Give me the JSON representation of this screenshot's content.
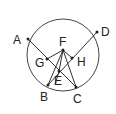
{
  "diagram": {
    "type": "circle-geometry",
    "circle": {
      "cx": 63,
      "cy": 55,
      "r": 36
    },
    "points": {
      "A": {
        "label": "A",
        "x": 28,
        "y": 39,
        "lx": 13,
        "ly": 44
      },
      "D": {
        "label": "D",
        "x": 97,
        "y": 32,
        "lx": 101,
        "ly": 36
      },
      "F": {
        "label": "F",
        "x": 63,
        "y": 50,
        "lx": 59,
        "ly": 46
      },
      "G": {
        "label": "G",
        "x": 47,
        "y": 59,
        "lx": 35,
        "ly": 67
      },
      "H": {
        "label": "H",
        "x": 72,
        "y": 58,
        "lx": 77,
        "ly": 66
      },
      "E": {
        "label": "E",
        "x": 59,
        "y": 71,
        "lx": 54,
        "ly": 85
      },
      "B": {
        "label": "B",
        "x": 48,
        "y": 85,
        "lx": 40,
        "ly": 101
      },
      "C": {
        "label": "C",
        "x": 76,
        "y": 87,
        "lx": 73,
        "ly": 103
      }
    },
    "segments": [
      [
        "A",
        "C"
      ],
      [
        "D",
        "B"
      ],
      [
        "G",
        "F"
      ],
      [
        "F",
        "H"
      ],
      [
        "F",
        "B"
      ],
      [
        "F",
        "C"
      ],
      [
        "F",
        "E"
      ],
      [
        "B",
        "C"
      ]
    ],
    "stroke_color": "#333333"
  }
}
